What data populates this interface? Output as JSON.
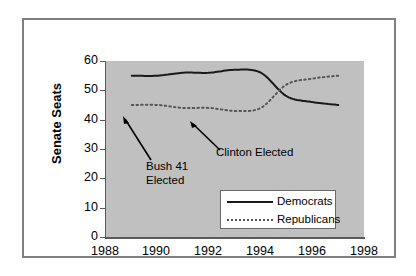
{
  "chart_data": {
    "type": "line",
    "title": "",
    "xlabel": "",
    "ylabel": "Senate Seats",
    "xlim": [
      1988,
      1998
    ],
    "ylim": [
      0,
      60
    ],
    "xticks": [
      1988,
      1990,
      1992,
      1994,
      1996,
      1998
    ],
    "yticks": [
      0,
      10,
      20,
      30,
      40,
      50,
      60
    ],
    "grid": false,
    "legend_position": "inside-lower-center",
    "x": [
      1989,
      1990,
      1991,
      1992,
      1993,
      1994,
      1995,
      1996,
      1997
    ],
    "series": [
      {
        "name": "Democrats",
        "style": "solid",
        "color": "#1a1a1a",
        "values": [
          55,
          55,
          56,
          56,
          57,
          56,
          48,
          46,
          45
        ]
      },
      {
        "name": "Republicans",
        "style": "dotted",
        "color": "#555555",
        "values": [
          45,
          45,
          44,
          44,
          43,
          44,
          52,
          54,
          55
        ]
      }
    ],
    "annotations": [
      {
        "text": "Bush 41\nElected",
        "points_to_x": 1989,
        "points_to_y": 41
      },
      {
        "text": "Clinton Elected",
        "points_to_x": 1991.2,
        "points_to_y": 40
      }
    ]
  },
  "axes": {
    "y_title": "Senate Seats",
    "y_tick_labels": [
      "60",
      "50",
      "40",
      "30",
      "20",
      "10",
      "0"
    ],
    "x_tick_labels": [
      "1988",
      "1990",
      "1992",
      "1994",
      "1996",
      "1998"
    ]
  },
  "legend": {
    "items": [
      {
        "label": "Democrats",
        "swatch": "solid-line-swatch"
      },
      {
        "label": "Republicans",
        "swatch": "dotted-line-swatch"
      }
    ]
  },
  "annotations": {
    "bush": "Bush 41\nElected",
    "clinton": "Clinton Elected"
  },
  "colors": {
    "plot_background": "#c0c0c0",
    "page_background": "#ffffff",
    "frame": "#808080",
    "democrats": "#1a1a1a",
    "republicans": "#555555"
  }
}
